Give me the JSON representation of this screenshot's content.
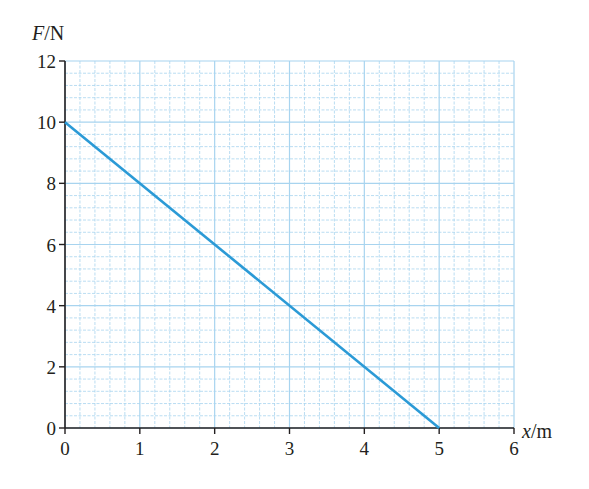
{
  "chart_data": {
    "type": "line",
    "title": "",
    "xlabel": "x/m",
    "ylabel": "F/N",
    "xlabel_var": "x",
    "xlabel_unit": "m",
    "ylabel_var": "F",
    "ylabel_unit": "N",
    "xlim": [
      0,
      6
    ],
    "ylim": [
      0,
      12
    ],
    "x_ticks": [
      "0",
      "1",
      "2",
      "3",
      "4",
      "5",
      "6"
    ],
    "y_ticks": [
      "0",
      "2",
      "4",
      "6",
      "8",
      "10",
      "12"
    ],
    "grid": true,
    "grid_minor_x": 0.2,
    "grid_minor_y": 0.4,
    "series": [
      {
        "name": "F vs x",
        "x": [
          0,
          5
        ],
        "y": [
          10,
          0
        ],
        "color": "#2b9ad6"
      }
    ],
    "colors": {
      "grid": "#a8d4ef",
      "axis": "#231f20",
      "line": "#2b9ad6"
    }
  }
}
